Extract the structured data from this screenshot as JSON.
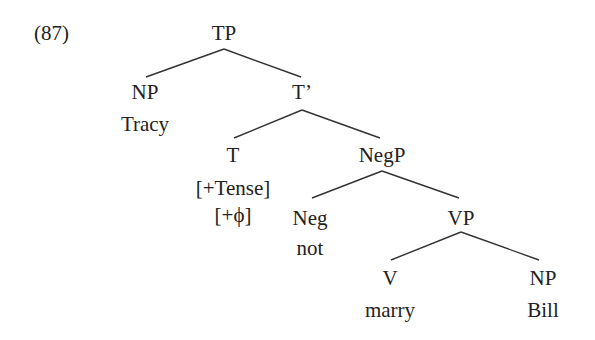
{
  "example_number": "(87)",
  "tree": {
    "TP": "TP",
    "NP_subject": "NP",
    "subject_word": "Tracy",
    "T_bar": "T’",
    "T": "T",
    "T_feature_1": "[+Tense]",
    "T_feature_2": "[+ϕ]",
    "NegP": "NegP",
    "Neg": "Neg",
    "neg_word": "not",
    "VP": "VP",
    "V": "V",
    "verb_word": "marry",
    "NP_object": "NP",
    "object_word": "Bill"
  }
}
